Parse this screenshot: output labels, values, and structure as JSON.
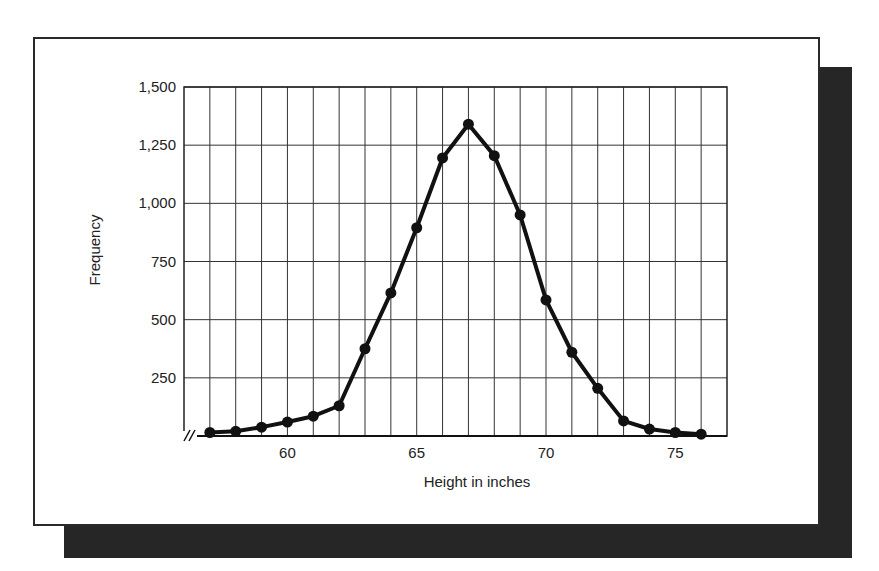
{
  "chart_data": {
    "type": "line",
    "title": "",
    "xlabel": "Height in inches",
    "ylabel": "Frequency",
    "x": [
      57,
      58,
      59,
      60,
      61,
      62,
      63,
      64,
      65,
      66,
      67,
      68,
      69,
      70,
      71,
      72,
      73,
      74,
      75,
      76
    ],
    "values": [
      15,
      20,
      38,
      60,
      85,
      130,
      375,
      615,
      895,
      1195,
      1340,
      1205,
      950,
      585,
      360,
      205,
      65,
      30,
      15,
      8
    ],
    "series": [
      {
        "name": "Frequency",
        "values": [
          15,
          20,
          38,
          60,
          85,
          130,
          375,
          615,
          895,
          1195,
          1340,
          1205,
          950,
          585,
          360,
          205,
          65,
          30,
          15,
          8
        ]
      }
    ],
    "xlim": [
      56,
      77
    ],
    "ylim": [
      0,
      1500
    ],
    "x_ticks": [
      60,
      65,
      70,
      75
    ],
    "x_tick_labels": [
      "60",
      "65",
      "70",
      "75"
    ],
    "y_ticks": [
      250,
      500,
      750,
      1000,
      1250,
      1500
    ],
    "y_tick_labels": [
      "250",
      "500",
      "750",
      "1,000",
      "1,250",
      "1,500"
    ],
    "grid": true,
    "axis_break": "x-axis break mark (//) near origin",
    "legend": null,
    "markers": "filled circles",
    "line_color": "#111111"
  }
}
